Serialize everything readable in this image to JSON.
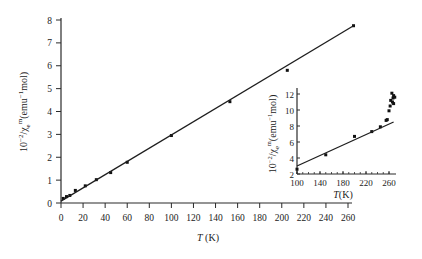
{
  "chart_data": [
    {
      "type": "scatter",
      "title": "",
      "xlabel": "T (K)",
      "ylabel": "10^-2/χ_e^m (emu^-1 mol)",
      "xlim": [
        0,
        265
      ],
      "ylim": [
        0,
        8
      ],
      "x_ticks": [
        0,
        20,
        40,
        60,
        80,
        100,
        120,
        140,
        160,
        180,
        200,
        220,
        240,
        260
      ],
      "y_ticks": [
        0,
        1,
        2,
        3,
        4,
        5,
        6,
        7,
        8
      ],
      "grid": false,
      "series": [
        {
          "name": "data",
          "x": [
            2,
            5,
            8,
            13,
            22,
            32,
            45,
            60,
            100,
            153,
            205,
            265
          ],
          "y": [
            0.2,
            0.28,
            0.33,
            0.55,
            0.75,
            1.02,
            1.33,
            1.78,
            2.95,
            4.43,
            5.8,
            7.75
          ]
        },
        {
          "name": "linear fit",
          "kind": "line",
          "x": [
            0,
            265
          ],
          "y": [
            0.08,
            7.75
          ]
        }
      ]
    },
    {
      "type": "scatter",
      "role": "inset",
      "xlabel": "T (K)",
      "ylabel": "10^-2/χ_e^m (emu^-1 mol)",
      "xlim": [
        100,
        270
      ],
      "ylim": [
        2,
        13
      ],
      "x_ticks": [
        100,
        140,
        180,
        220,
        260
      ],
      "y_ticks": [
        2,
        4,
        6,
        8,
        10,
        12
      ],
      "grid": false,
      "series": [
        {
          "name": "data",
          "x": [
            100,
            150,
            200,
            230,
            245,
            255,
            257,
            260,
            262,
            263,
            265,
            266,
            267,
            268,
            268,
            270
          ],
          "y": [
            2.6,
            4.4,
            6.7,
            7.3,
            7.9,
            8.7,
            8.8,
            9.9,
            10.5,
            11.2,
            12.1,
            11.0,
            11.5,
            11.8,
            10.8,
            11.6
          ]
        },
        {
          "name": "linear fit",
          "kind": "line",
          "x": [
            100,
            268
          ],
          "y": [
            3.0,
            8.5
          ]
        }
      ]
    }
  ],
  "labels": {
    "x_axis": "T",
    "x_unit": "(K)",
    "y_axis_prefix": "10",
    "y_axis_exp": "−2",
    "y_axis_mid": "/χ",
    "y_axis_sub": "e",
    "y_axis_sup": "m",
    "y_axis_unit": "(emu",
    "y_axis_unit_exp": "−1",
    "y_axis_unit_end": "mol)"
  }
}
